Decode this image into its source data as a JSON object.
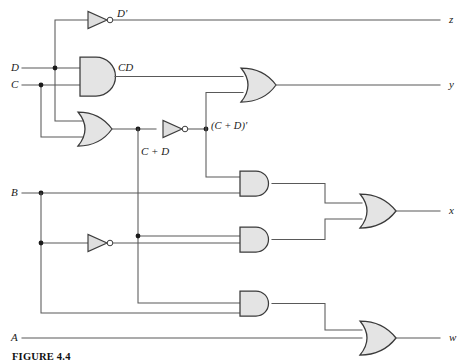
{
  "figure": {
    "caption": "FIGURE 4.4",
    "type": "logic-circuit-diagram"
  },
  "inputs": [
    {
      "name": "D",
      "label": "D",
      "x": 14,
      "y": 62
    },
    {
      "name": "C",
      "label": "C",
      "x": 14,
      "y": 79
    },
    {
      "name": "B",
      "label": "B",
      "x": 14,
      "y": 187
    },
    {
      "name": "A",
      "label": "A",
      "x": 14,
      "y": 332
    }
  ],
  "outputs": [
    {
      "name": "z",
      "label": "z",
      "x": 450,
      "y": 14
    },
    {
      "name": "y",
      "label": "y",
      "x": 450,
      "y": 78
    },
    {
      "name": "x",
      "label": "x",
      "x": 450,
      "y": 205
    },
    {
      "name": "w",
      "label": "w",
      "x": 450,
      "y": 332
    }
  ],
  "signal_labels": [
    {
      "name": "d-not",
      "label": "D'",
      "x": 117,
      "y": 8
    },
    {
      "name": "cd-product",
      "label": "CD",
      "x": 118,
      "y": 62
    },
    {
      "name": "c-or-d",
      "label": "C + D",
      "x": 140,
      "y": 146
    },
    {
      "name": "c-or-d-not",
      "label": "(C + D)'",
      "x": 211,
      "y": 121
    }
  ],
  "gates": [
    {
      "name": "inverter-d",
      "type": "NOT",
      "inputs": [
        "D"
      ],
      "output": "D'"
    },
    {
      "name": "and-cd",
      "type": "AND",
      "inputs": [
        "D",
        "C"
      ],
      "output": "CD"
    },
    {
      "name": "or-cd",
      "type": "OR",
      "inputs": [
        "D",
        "C"
      ],
      "output": "C + D"
    },
    {
      "name": "inverter-cd",
      "type": "NOT",
      "inputs": [
        "C + D"
      ],
      "output": "(C + D)'"
    },
    {
      "name": "or-y",
      "type": "OR",
      "inputs": [
        "CD",
        "(C + D)'"
      ],
      "output": "y"
    },
    {
      "name": "inverter-b",
      "type": "NOT",
      "inputs": [
        "B"
      ],
      "output": "B'"
    },
    {
      "name": "and-x-upper",
      "type": "AND",
      "inputs": [
        "(C + D)'",
        "B"
      ],
      "output": ""
    },
    {
      "name": "and-x-lower",
      "type": "AND",
      "inputs": [
        "C + D",
        "B'"
      ],
      "output": ""
    },
    {
      "name": "or-x",
      "type": "OR",
      "inputs": [
        "and-x-upper",
        "and-x-lower"
      ],
      "output": "x"
    },
    {
      "name": "and-w",
      "type": "AND",
      "inputs": [
        "C + D",
        "B"
      ],
      "output": ""
    },
    {
      "name": "or-w",
      "type": "OR",
      "inputs": [
        "and-w",
        "A"
      ],
      "output": "w"
    }
  ],
  "colors": {
    "wire": "#595959",
    "gate_fill": "#e4e4e4",
    "gate_stroke": "#3a3a3a",
    "junction": "#1b1b1b",
    "background": "#ffffff"
  }
}
